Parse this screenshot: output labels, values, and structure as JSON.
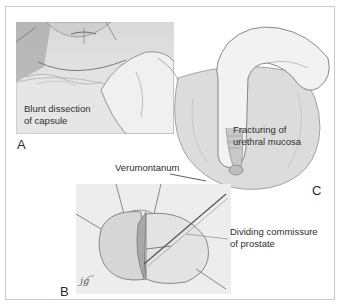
{
  "figure": {
    "panels": [
      {
        "id": "A",
        "letter": "A",
        "caption_line1": "Blunt dissection",
        "caption_line2": "of capsule"
      },
      {
        "id": "B",
        "letter": "B",
        "caption_line1": "Dividing commissure",
        "caption_line2": "of prostate",
        "signature": "jg"
      },
      {
        "id": "C",
        "letter": "C",
        "caption_line1": "Fracturing of",
        "caption_line2": "urethral mucosa",
        "pointer_label": "Verumontanum"
      }
    ]
  },
  "colors": {
    "frame_border": "#c9c9c9",
    "tissue_light": "#e4e4e4",
    "tissue_mid": "#bdbdbd",
    "tissue_dark": "#8a8a8a",
    "text": "#2e2e2e"
  }
}
